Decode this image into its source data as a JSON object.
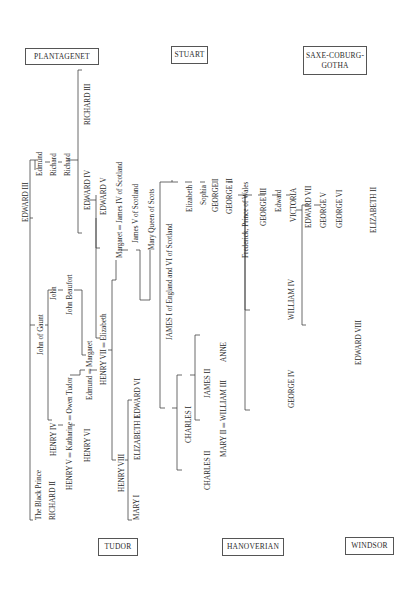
{
  "houses": {
    "plantagenet": "PLANTAGENET",
    "stuart": "STUART",
    "saxe_coburg_1": "SAXE-COBURG-",
    "saxe_coburg_2": "GOTHA",
    "tudor": "TUDOR",
    "hanoverian": "HANOVERIAN",
    "windsor": "WINDSOR"
  },
  "people": {
    "edward_iii": "EDWARD III",
    "black_prince": "The Black Prince",
    "richard_ii": "RICHARD II",
    "john_of_gaunt": "John of Gaunt",
    "henry_iv": "HENRY IV",
    "henry_v": "HENRY V ═ Katharine ═ Owen Tudor",
    "henry_vi": "HENRY VI",
    "john": "John",
    "john_beaufort": "John Beaufort",
    "edmund_margaret": "Edmund ═ Margaret",
    "henry_vii": "HENRY VII ═ Elizabeth",
    "henry_viii": "HENRY VIII",
    "mary_i": "MARY I",
    "elizabeth_i": "ELIZABETH I",
    "edward_vi": "EDWARD VI",
    "edmund": "Edmund",
    "richard_a": "Richard",
    "richard_b": "Richard",
    "richard_iii": "RICHARD III",
    "edward_iv": "EDWARD IV",
    "edward_v": "EDWARD V",
    "margaret": "Margaret ═ James IV of Scotland",
    "james_v": "James V of Scotland",
    "mary_qos": "Mary Queen of Scots",
    "james_i": "JAMES I of England and VI of Scotland",
    "charles_i": "CHARLES I",
    "charles_ii": "CHARLES II",
    "james_ii": "JAMES II",
    "mary_ii": "MARY II ═ WILLIAM III",
    "anne": "ANNE",
    "elizabeth": "Elizabeth",
    "sophia": "Sophia",
    "george_i": "GEORGE I",
    "george_ii": "GEORGE II",
    "frederick": "Frederick, Prince of Wales",
    "george_iii": "GEORGE III",
    "george_iv": "GEORGE IV",
    "william_iv": "WILLIAM IV",
    "edward": "Edward",
    "victoria": "VICTORIA",
    "edward_vii": "EDWARD VII",
    "george_v": "GEORGE V",
    "edward_viii": "EDWARD VIII",
    "george_vi": "GEORGE VI",
    "elizabeth_ii": "ELIZABETH II"
  }
}
